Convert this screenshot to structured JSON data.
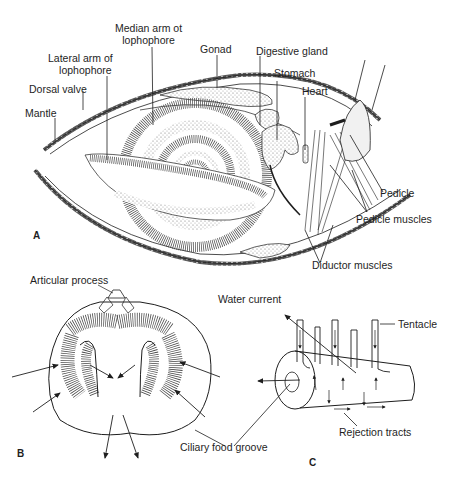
{
  "figure": {
    "panels": [
      {
        "id": "A",
        "letter": "A",
        "title": "Brachiopod internal anatomy (longitudinal section)",
        "labels": {
          "median_arm_line1": "Median arm ot",
          "median_arm_line2": "lophophore",
          "lateral_arm_line1": "Lateral arm of",
          "lateral_arm_line2": "lophophore",
          "gonad": "Gonad",
          "digestive_gland": "Digestive gland",
          "stomach": "Stomach",
          "heart": "Heart",
          "dorsal_valve": "Dorsal valve",
          "mantle": "Mantle",
          "pedicle": "Pedicle",
          "pedicle_muscles": "Pedicle muscles",
          "diductor_muscles": "Diductor muscles"
        }
      },
      {
        "id": "B",
        "letter": "B",
        "labels": {
          "articular_process": "Articular process"
        }
      },
      {
        "id": "C",
        "letter": "C",
        "labels": {
          "water_current": "Water current",
          "tentacle": "Tentacle",
          "rejection_tracts": "Rejection tracts",
          "ciliary_food_groove": "Ciliary food groove"
        }
      }
    ],
    "colors": {
      "ink": "#1e1e1e",
      "background": "#ffffff",
      "stipple": "#9a9a9a"
    }
  }
}
